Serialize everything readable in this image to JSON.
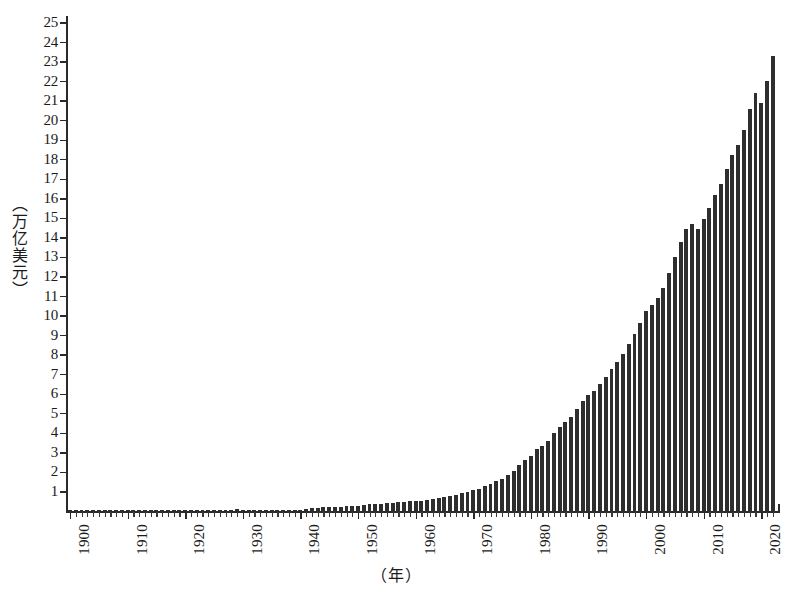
{
  "figure": {
    "y_axis_title": "（万亿美元）",
    "x_axis_title": "（年）",
    "axis_color": "#2a2a2a",
    "bar_color": "#2e2e2e",
    "background_color": "#ffffff"
  },
  "chart_data": {
    "type": "bar",
    "title": "",
    "subtitle": "",
    "xlabel": "（年）",
    "ylabel": "（万亿美元）",
    "xlim": [
      1900,
      2023
    ],
    "ylim": [
      0,
      25.5
    ],
    "grid": false,
    "legend": null,
    "y_ticks": [
      1,
      2,
      3,
      4,
      5,
      6,
      7,
      8,
      9,
      10,
      11,
      12,
      13,
      14,
      15,
      16,
      17,
      18,
      19,
      20,
      21,
      22,
      23,
      24,
      25
    ],
    "x_ticks_major": [
      1900,
      1910,
      1920,
      1930,
      1940,
      1950,
      1960,
      1970,
      1980,
      1990,
      2000,
      2010,
      2020
    ],
    "x_tick_labels": [
      "1900",
      "1910",
      "1920",
      "1930",
      "1940",
      "1950",
      "1960",
      "1970",
      "1980",
      "1990",
      "2000",
      "2010",
      "2020"
    ],
    "categories": [
      1900,
      1901,
      1902,
      1903,
      1904,
      1905,
      1906,
      1907,
      1908,
      1909,
      1910,
      1911,
      1912,
      1913,
      1914,
      1915,
      1916,
      1917,
      1918,
      1919,
      1920,
      1921,
      1922,
      1923,
      1924,
      1925,
      1926,
      1927,
      1928,
      1929,
      1930,
      1931,
      1932,
      1933,
      1934,
      1935,
      1936,
      1937,
      1938,
      1939,
      1940,
      1941,
      1942,
      1943,
      1944,
      1945,
      1946,
      1947,
      1948,
      1949,
      1950,
      1951,
      1952,
      1953,
      1954,
      1955,
      1956,
      1957,
      1958,
      1959,
      1960,
      1961,
      1962,
      1963,
      1964,
      1965,
      1966,
      1967,
      1968,
      1969,
      1970,
      1971,
      1972,
      1973,
      1974,
      1975,
      1976,
      1977,
      1978,
      1979,
      1980,
      1981,
      1982,
      1983,
      1984,
      1985,
      1986,
      1987,
      1988,
      1989,
      1990,
      1991,
      1992,
      1993,
      1994,
      1995,
      1996,
      1997,
      1998,
      1999,
      2000,
      2001,
      2002,
      2003,
      2004,
      2005,
      2006,
      2007,
      2008,
      2009,
      2010,
      2011,
      2012,
      2013,
      2014,
      2015,
      2016,
      2017,
      2018,
      2019,
      2020,
      2021,
      2022
    ],
    "values": [
      0.021,
      0.022,
      0.024,
      0.025,
      0.025,
      0.028,
      0.032,
      0.033,
      0.03,
      0.034,
      0.035,
      0.036,
      0.039,
      0.04,
      0.037,
      0.039,
      0.05,
      0.06,
      0.076,
      0.084,
      0.089,
      0.074,
      0.074,
      0.086,
      0.087,
      0.091,
      0.097,
      0.096,
      0.098,
      0.105,
      0.092,
      0.077,
      0.059,
      0.057,
      0.067,
      0.074,
      0.085,
      0.093,
      0.087,
      0.093,
      0.103,
      0.129,
      0.166,
      0.203,
      0.224,
      0.228,
      0.228,
      0.25,
      0.275,
      0.273,
      0.3,
      0.347,
      0.367,
      0.389,
      0.391,
      0.427,
      0.45,
      0.475,
      0.482,
      0.522,
      0.543,
      0.563,
      0.605,
      0.639,
      0.686,
      0.744,
      0.815,
      0.862,
      0.943,
      1.02,
      1.076,
      1.168,
      1.282,
      1.429,
      1.549,
      1.689,
      1.878,
      2.086,
      2.357,
      2.632,
      2.857,
      3.207,
      3.344,
      3.634,
      4.038,
      4.339,
      4.58,
      4.855,
      5.236,
      5.642,
      5.963,
      6.158,
      6.52,
      6.859,
      7.287,
      7.64,
      8.073,
      8.578,
      9.063,
      9.631,
      10.251,
      10.582,
      10.936,
      11.458,
      12.214,
      13.037,
      13.815,
      14.452,
      14.713,
      14.449,
      14.992,
      15.543,
      16.197,
      16.785,
      17.527,
      18.238,
      18.745,
      19.543,
      20.612,
      21.433,
      20.894,
      22.04,
      23.32
    ],
    "value_unit": "trillion USD",
    "n_bars": 123
  }
}
